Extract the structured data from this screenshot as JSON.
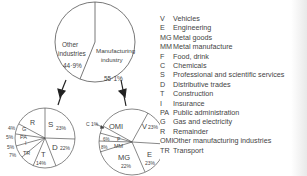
{
  "top_pie": {
    "segments": [
      {
        "name": "Other industries",
        "line1": "Other",
        "line2": "industries",
        "percent": "44·9%"
      },
      {
        "name": "Manufacturing industry",
        "line1": "Manufacturing",
        "line2": "industry",
        "percent": "55·1%"
      }
    ]
  },
  "other_pie": {
    "labels": {
      "R": "R",
      "S": "S",
      "S_pct": "23%",
      "D": "D",
      "D_pct": "22%",
      "T": "T",
      "T_pct": "14%",
      "TR": "TR",
      "TR_pct": "7%",
      "I": "I",
      "I_pct": "5%",
      "PA": "PA",
      "PA_pct": "5%",
      "G": "G",
      "G_pct": "4%"
    }
  },
  "manufacturing_pie": {
    "labels": {
      "OMI": "OMI",
      "V": "V",
      "V_pct": "23%",
      "E": "E",
      "E_pct": "23%",
      "MG": "MG",
      "MG_pct": "22%",
      "MM": "MM",
      "MM_pct": "8%",
      "F": "F",
      "F_pct": "6%",
      "C_pct": "C 1%"
    }
  },
  "legend": [
    {
      "code": "V",
      "label": "Vehicles"
    },
    {
      "code": "E",
      "label": "Engineering"
    },
    {
      "code": "MG",
      "label": "Metal goods"
    },
    {
      "code": "MM",
      "label": "Metal manufacture"
    },
    {
      "code": "F",
      "label": "Food, drink"
    },
    {
      "code": "C",
      "label": "Chemicals"
    },
    {
      "code": "S",
      "label": "Professional and scientific services"
    },
    {
      "code": "D",
      "label": "Distributive trades"
    },
    {
      "code": "T",
      "label": "Construction"
    },
    {
      "code": "I",
      "label": "Insurance"
    },
    {
      "code": "PA",
      "label": "Public administration"
    },
    {
      "code": "G",
      "label": "Gas and electricity"
    },
    {
      "code": "R",
      "label": "Remainder"
    },
    {
      "code": "OMI",
      "label": "Other manufacturing industries"
    },
    {
      "code": "TR",
      "label": "Transport"
    }
  ]
}
